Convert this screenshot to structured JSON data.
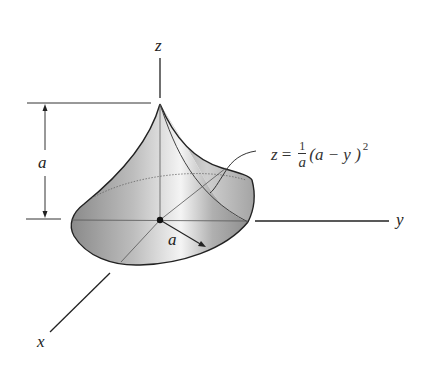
{
  "figure": {
    "type": "3d-surface-diagram",
    "axes": {
      "x_label": "x",
      "y_label": "y",
      "z_label": "z"
    },
    "dimensions": {
      "height_label": "a",
      "radius_label": "a"
    },
    "equation": {
      "lhs": "z",
      "equals": "=",
      "frac_num": "1",
      "frac_den": "a",
      "body": "(a − y )",
      "exponent": "2",
      "full_text": "z = (1/a)(a − y)^2"
    },
    "colors": {
      "line": "#222222",
      "surface_dark": "#8c8c8c",
      "surface_light": "#f2f2f2",
      "background": "#ffffff"
    }
  }
}
